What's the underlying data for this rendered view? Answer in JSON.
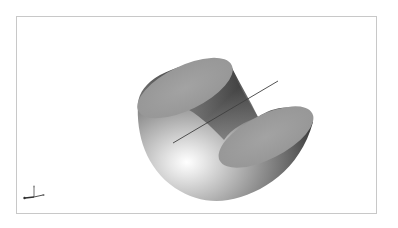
{
  "viewport": {
    "background": "#ffffff",
    "border_color": "#c8c8c8"
  },
  "model": {
    "description": "curved solid with two planar elliptical faces and a central axis line",
    "face_color": "#9a9a9a",
    "axis_line_color": "#404040"
  },
  "triad": {
    "icon": "xyz-axis-triad-icon"
  }
}
